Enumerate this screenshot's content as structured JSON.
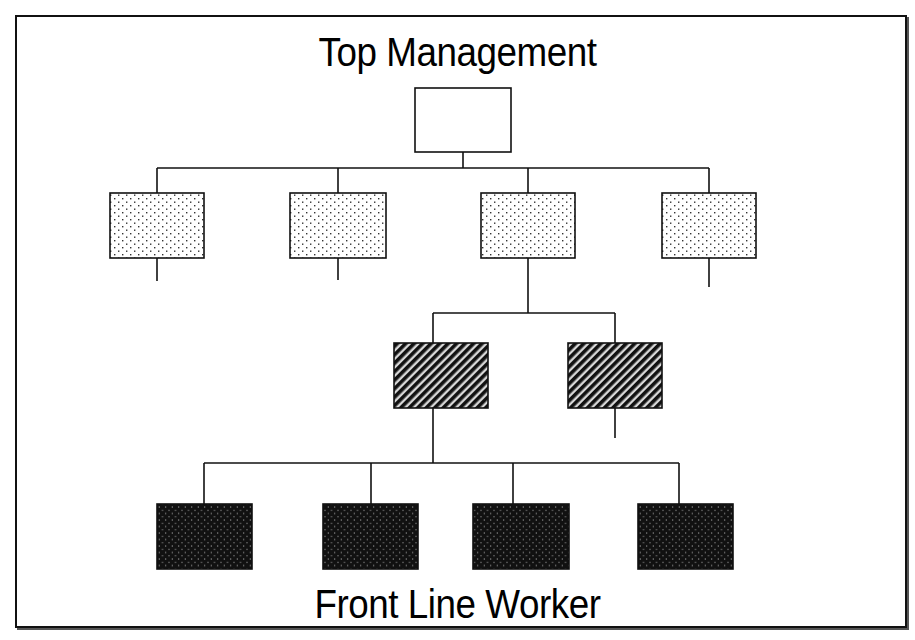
{
  "diagram": {
    "type": "organizational-hierarchy",
    "top_label": "Top Management",
    "bottom_label": "Front Line Worker",
    "colors": {
      "line": "#111111",
      "background": "#ffffff",
      "box_border": "#111111"
    },
    "levels": [
      {
        "level": 1,
        "fill": "plain-white",
        "boxes": [
          {
            "id": "top",
            "x": 415,
            "y": 88,
            "w": 96,
            "h": 64
          }
        ]
      },
      {
        "level": 2,
        "fill": "light-dot",
        "boxes": [
          {
            "id": "m1",
            "x": 110,
            "y": 193,
            "w": 94,
            "h": 65
          },
          {
            "id": "m2",
            "x": 290,
            "y": 193,
            "w": 96,
            "h": 65
          },
          {
            "id": "m3",
            "x": 481,
            "y": 193,
            "w": 94,
            "h": 65
          },
          {
            "id": "m4",
            "x": 662,
            "y": 193,
            "w": 94,
            "h": 65
          }
        ]
      },
      {
        "level": 3,
        "fill": "diagonal-hatch",
        "boxes": [
          {
            "id": "s1",
            "x": 394,
            "y": 343,
            "w": 94,
            "h": 65
          },
          {
            "id": "s2",
            "x": 568,
            "y": 343,
            "w": 94,
            "h": 65
          }
        ]
      },
      {
        "level": 4,
        "fill": "dense-dot-dark",
        "boxes": [
          {
            "id": "w1",
            "x": 157,
            "y": 504,
            "w": 95,
            "h": 65
          },
          {
            "id": "w2",
            "x": 323,
            "y": 504,
            "w": 95,
            "h": 65
          },
          {
            "id": "w3",
            "x": 473,
            "y": 504,
            "w": 96,
            "h": 65
          },
          {
            "id": "w4",
            "x": 638,
            "y": 504,
            "w": 95,
            "h": 65
          }
        ]
      }
    ],
    "connectors": [
      [
        463,
        152,
        463,
        168
      ],
      [
        157,
        168,
        709,
        168
      ],
      [
        157,
        168,
        157,
        193
      ],
      [
        338,
        168,
        338,
        193
      ],
      [
        528,
        168,
        528,
        193
      ],
      [
        709,
        168,
        709,
        193
      ],
      [
        157,
        258,
        157,
        281
      ],
      [
        338,
        258,
        338,
        280
      ],
      [
        528,
        258,
        528,
        313
      ],
      [
        709,
        258,
        709,
        287
      ],
      [
        433,
        313,
        615,
        313
      ],
      [
        433,
        313,
        433,
        343
      ],
      [
        615,
        313,
        615,
        343
      ],
      [
        433,
        408,
        433,
        463
      ],
      [
        615,
        408,
        615,
        438
      ],
      [
        204,
        463,
        679,
        463
      ],
      [
        204,
        463,
        204,
        504
      ],
      [
        371,
        463,
        371,
        504
      ],
      [
        513,
        463,
        513,
        504
      ],
      [
        679,
        463,
        679,
        504
      ]
    ]
  }
}
